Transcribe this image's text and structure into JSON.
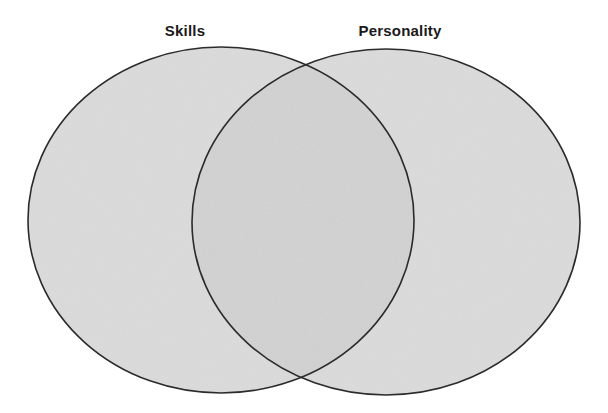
{
  "diagram": {
    "type": "venn",
    "sets": [
      {
        "id": "skills",
        "label": "Skills"
      },
      {
        "id": "personality",
        "label": "Personality"
      }
    ],
    "overlap": {
      "sets": [
        "skills",
        "personality"
      ],
      "label": ""
    },
    "colors": {
      "fill": "#cfcfcf",
      "fill_opacity": 0.75,
      "stroke": "#2b2b2b",
      "background": "#ffffff"
    }
  }
}
